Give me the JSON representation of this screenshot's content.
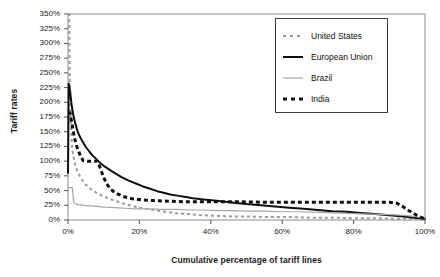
{
  "chart_data": {
    "type": "line",
    "title": "",
    "xlabel": "Cumulative percentage of tariff lines",
    "ylabel": "Tariff rates",
    "xlim": [
      0,
      100
    ],
    "ylim": [
      0,
      350
    ],
    "grid": false,
    "legend_position": "top-right",
    "x_ticks": [
      "0%",
      "20%",
      "40%",
      "60%",
      "80%",
      "100%"
    ],
    "x_tick_values": [
      0,
      20,
      40,
      60,
      80,
      100
    ],
    "y_ticks": [
      "0%",
      "25%",
      "50%",
      "75%",
      "100%",
      "125%",
      "150%",
      "175%",
      "200%",
      "225%",
      "250%",
      "275%",
      "300%",
      "325%",
      "350%"
    ],
    "y_tick_values": [
      0,
      25,
      50,
      75,
      100,
      125,
      150,
      175,
      200,
      225,
      250,
      275,
      300,
      325,
      350
    ],
    "series": [
      {
        "name": "United States",
        "style": "dashed",
        "color": "#9a9a9a",
        "width": 2,
        "points": [
          [
            0.0,
            350
          ],
          [
            0.3,
            350
          ],
          [
            0.5,
            245
          ],
          [
            0.8,
            160
          ],
          [
            1.2,
            120
          ],
          [
            2.0,
            92
          ],
          [
            3.0,
            78
          ],
          [
            4.0,
            68
          ],
          [
            5.0,
            60
          ],
          [
            6.5,
            52
          ],
          [
            8.0,
            46
          ],
          [
            10.0,
            40
          ],
          [
            12.0,
            35
          ],
          [
            14.0,
            31
          ],
          [
            16.0,
            27
          ],
          [
            18.0,
            24
          ],
          [
            20.0,
            21
          ],
          [
            23.0,
            18
          ],
          [
            26.0,
            15
          ],
          [
            30.0,
            12
          ],
          [
            34.0,
            10
          ],
          [
            38.0,
            8
          ],
          [
            42.0,
            7
          ],
          [
            46.0,
            6
          ],
          [
            50.0,
            6
          ],
          [
            56.0,
            5
          ],
          [
            62.0,
            5
          ],
          [
            68.0,
            4
          ],
          [
            74.0,
            4
          ],
          [
            80.0,
            3
          ],
          [
            86.0,
            3
          ],
          [
            92.0,
            2
          ],
          [
            96.0,
            2
          ],
          [
            100.0,
            1
          ]
        ]
      },
      {
        "name": "European Union",
        "style": "solid",
        "color": "#101010",
        "width": 2,
        "points": [
          [
            0.0,
            80
          ],
          [
            0.2,
            232
          ],
          [
            0.6,
            218
          ],
          [
            1.0,
            196
          ],
          [
            1.5,
            178
          ],
          [
            2.0,
            165
          ],
          [
            2.6,
            152
          ],
          [
            3.2,
            143
          ],
          [
            4.0,
            134
          ],
          [
            5.0,
            124
          ],
          [
            6.0,
            116
          ],
          [
            7.0,
            109
          ],
          [
            8.0,
            103
          ],
          [
            9.0,
            97
          ],
          [
            10.0,
            92
          ],
          [
            11.5,
            86
          ],
          [
            13.0,
            80
          ],
          [
            15.0,
            73
          ],
          [
            17.0,
            67
          ],
          [
            19.0,
            62
          ],
          [
            21.0,
            57
          ],
          [
            23.0,
            53
          ],
          [
            25.0,
            49
          ],
          [
            27.0,
            46
          ],
          [
            29.0,
            43
          ],
          [
            31.0,
            41
          ],
          [
            33.0,
            39
          ],
          [
            35.0,
            37
          ],
          [
            38.0,
            35
          ],
          [
            41.0,
            33
          ],
          [
            44.0,
            31
          ],
          [
            47.0,
            29
          ],
          [
            50.0,
            27
          ],
          [
            54.0,
            25
          ],
          [
            58.0,
            23
          ],
          [
            62.0,
            21
          ],
          [
            66.0,
            19
          ],
          [
            70.0,
            17
          ],
          [
            74.0,
            15
          ],
          [
            78.0,
            14
          ],
          [
            82.0,
            12
          ],
          [
            86.0,
            10
          ],
          [
            90.0,
            8
          ],
          [
            94.0,
            6
          ],
          [
            97.0,
            4
          ],
          [
            100.0,
            2
          ]
        ]
      },
      {
        "name": "Brazil",
        "style": "solid",
        "color": "#a6a6a6",
        "width": 1.2,
        "points": [
          [
            0.0,
            55
          ],
          [
            1.2,
            55
          ],
          [
            1.6,
            30
          ],
          [
            2.2,
            27
          ],
          [
            3.0,
            26
          ],
          [
            4.5,
            25
          ],
          [
            6.0,
            24
          ],
          [
            8.0,
            23
          ],
          [
            10.0,
            22
          ],
          [
            13.0,
            21
          ],
          [
            16.0,
            20
          ],
          [
            19.0,
            19
          ],
          [
            22.0,
            19
          ],
          [
            26.0,
            18
          ],
          [
            30.0,
            18
          ],
          [
            34.0,
            17
          ],
          [
            38.0,
            17
          ],
          [
            42.0,
            16
          ],
          [
            46.0,
            16
          ],
          [
            50.0,
            15
          ],
          [
            55.0,
            15
          ],
          [
            60.0,
            14
          ],
          [
            65.0,
            14
          ],
          [
            70.0,
            13
          ],
          [
            75.0,
            12
          ],
          [
            80.0,
            11
          ],
          [
            85.0,
            10
          ],
          [
            90.0,
            9
          ],
          [
            94.0,
            8
          ],
          [
            97.0,
            6
          ],
          [
            100.0,
            3
          ]
        ]
      },
      {
        "name": "India",
        "style": "dashed",
        "color": "#101010",
        "width": 3,
        "points": [
          [
            0.0,
            182
          ],
          [
            0.6,
            182
          ],
          [
            1.2,
            160
          ],
          [
            1.8,
            140
          ],
          [
            2.4,
            126
          ],
          [
            3.0,
            116
          ],
          [
            3.6,
            108
          ],
          [
            4.2,
            101
          ],
          [
            5.5,
            100
          ],
          [
            7.0,
            100
          ],
          [
            8.2,
            100
          ],
          [
            8.8,
            92
          ],
          [
            9.4,
            82
          ],
          [
            10.0,
            72
          ],
          [
            10.8,
            62
          ],
          [
            11.6,
            55
          ],
          [
            12.6,
            49
          ],
          [
            14.0,
            44
          ],
          [
            16.0,
            39
          ],
          [
            18.0,
            36
          ],
          [
            21.0,
            34
          ],
          [
            24.0,
            33
          ],
          [
            28.0,
            32
          ],
          [
            33.0,
            31
          ],
          [
            40.0,
            31
          ],
          [
            48.0,
            31
          ],
          [
            56.0,
            30
          ],
          [
            64.0,
            30
          ],
          [
            72.0,
            30
          ],
          [
            80.0,
            30
          ],
          [
            86.0,
            30
          ],
          [
            90.0,
            30
          ],
          [
            92.0,
            29
          ],
          [
            94.0,
            22
          ],
          [
            96.0,
            14
          ],
          [
            98.0,
            7
          ],
          [
            100.0,
            2
          ]
        ]
      }
    ]
  },
  "legend": {
    "items": [
      {
        "label": "United States"
      },
      {
        "label": "European Union"
      },
      {
        "label": "Brazil"
      },
      {
        "label": "India"
      }
    ]
  }
}
